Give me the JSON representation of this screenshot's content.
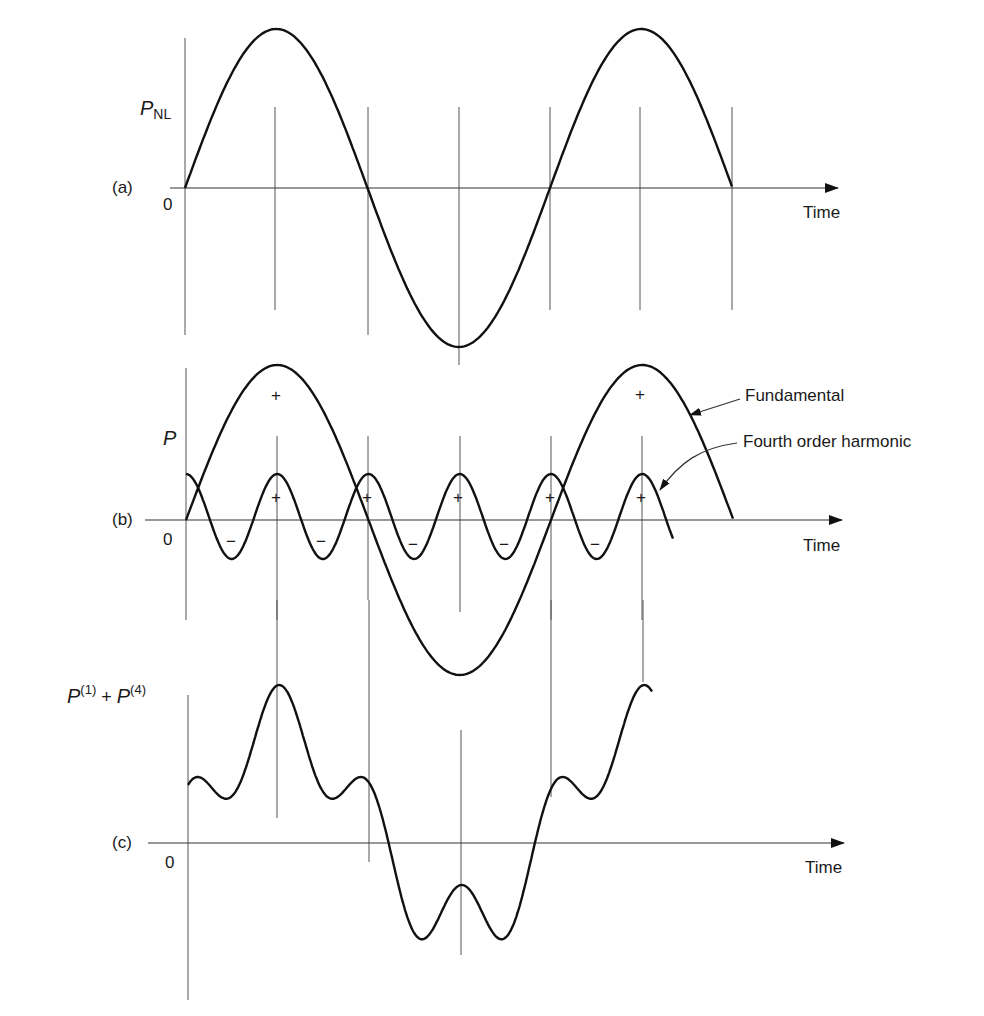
{
  "panels": [
    {
      "id": "a",
      "tag": "(a)",
      "ylabel_main": "P",
      "ylabel_sub": "NL",
      "origin": "0",
      "xlabel": "Time"
    },
    {
      "id": "b",
      "tag": "(b)",
      "ylabel_main": "P",
      "origin": "0",
      "xlabel": "Time",
      "annotations": {
        "fundamental": "Fundamental",
        "harmonic": "Fourth order harmonic"
      },
      "signs": {
        "plus": "+",
        "minus": "−"
      }
    },
    {
      "id": "c",
      "tag": "(c)",
      "ylabel_p1": "P",
      "ylabel_sup1": "(1)",
      "ylabel_plus": " + ",
      "ylabel_p4": "P",
      "ylabel_sup4": "(4)",
      "origin": "0",
      "xlabel": "Time"
    }
  ],
  "colors": {
    "curve": "#111111",
    "grid": "#555555"
  },
  "chart_data": [
    {
      "type": "line",
      "title": "(a) Nonlinear polarization P_NL vs time",
      "xlabel": "Time",
      "ylabel": "P_NL",
      "series": [
        {
          "name": "P_NL",
          "function": "sin(t)",
          "x_range_periods": [
            0,
            1.5
          ]
        }
      ],
      "grid": false
    },
    {
      "type": "line",
      "title": "(b) Fundamental and fourth order harmonic",
      "xlabel": "Time",
      "ylabel": "P",
      "series": [
        {
          "name": "Fundamental",
          "function": "sin(t)",
          "amplitude": 1.0
        },
        {
          "name": "Fourth order harmonic",
          "function": "cos(4t)",
          "amplitude": 0.3
        }
      ],
      "grid": false
    },
    {
      "type": "line",
      "title": "(c) Sum P(1) + P(4)",
      "xlabel": "Time",
      "ylabel": "P(1) + P(4)",
      "series": [
        {
          "name": "P(1)+P(4)",
          "function": "sin(t)+0.3cos(4t)"
        }
      ],
      "grid": false
    }
  ]
}
